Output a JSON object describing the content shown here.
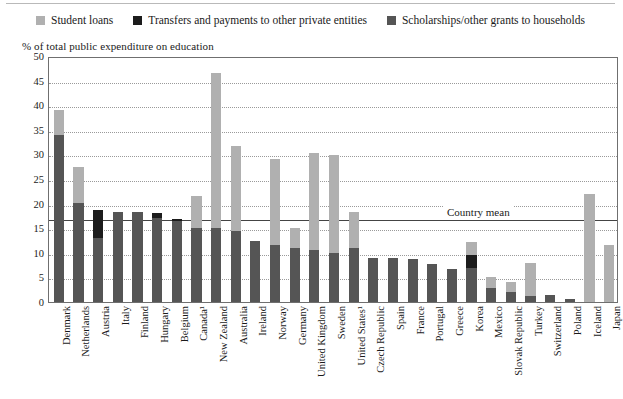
{
  "legend": {
    "items": [
      {
        "label": "Student loans",
        "color": "#b0b0b0",
        "key": "loans"
      },
      {
        "label": "Transfers and payments to other private entities",
        "color": "#1c1c1c",
        "key": "transfers"
      },
      {
        "label": "Scholarships/other grants to households",
        "color": "#555555",
        "key": "scholarships"
      }
    ]
  },
  "axis": {
    "ylabel": "% of total public expenditure on education",
    "yticks": [
      0,
      5,
      10,
      15,
      20,
      25,
      30,
      35,
      40,
      45,
      50
    ],
    "ymin": 0,
    "ymax": 50
  },
  "annotation": {
    "mean_label": "Country mean",
    "mean_value": 17
  },
  "chart_data": {
    "type": "bar",
    "stacked": true,
    "title": "",
    "xlabel": "",
    "ylabel": "% of total public expenditure on education",
    "ylim": [
      0,
      50
    ],
    "grid": true,
    "legend_position": "top",
    "categories": [
      "Denmark",
      "Netherlands",
      "Austria",
      "Italy",
      "Finland",
      "Hungary",
      "Belgium",
      "Canada¹",
      "New Zealand",
      "Australia",
      "Ireland",
      "Norway",
      "Germany",
      "United Kingdom",
      "Sweden",
      "United States¹",
      "Czech Republic",
      "Spain",
      "France",
      "Portugal",
      "Greece",
      "Korea",
      "Mexico",
      "Slovak Republic",
      "Turkey",
      "Switzerland",
      "Poland",
      "Iceland",
      "Japan"
    ],
    "series": [
      {
        "name": "Scholarships/other grants to households",
        "color": "#555555",
        "values": [
          34.0,
          20.2,
          13.0,
          18.3,
          18.2,
          17.0,
          16.4,
          15.0,
          15.0,
          14.5,
          12.3,
          11.5,
          11.0,
          10.5,
          10.0,
          11.0,
          9.0,
          9.0,
          8.8,
          7.8,
          6.8,
          7.0,
          2.8,
          2.0,
          1.2,
          1.4,
          0.7,
          0.0,
          0.0
        ]
      },
      {
        "name": "Transfers and payments to other private entities",
        "color": "#1c1c1c",
        "values": [
          0.0,
          0.0,
          5.7,
          0.0,
          0.0,
          1.0,
          0.4,
          0.0,
          0.0,
          0.0,
          0.0,
          0.0,
          0.0,
          0.0,
          0.0,
          0.0,
          0.0,
          0.0,
          0.0,
          0.0,
          0.0,
          2.6,
          0.0,
          0.0,
          0.0,
          0.0,
          0.0,
          0.0,
          0.0
        ]
      },
      {
        "name": "Student loans",
        "color": "#b0b0b0",
        "values": [
          5.0,
          7.3,
          0.0,
          0.0,
          0.0,
          0.0,
          0.0,
          6.5,
          31.5,
          17.3,
          0.0,
          17.5,
          4.0,
          19.7,
          19.8,
          7.2,
          0.0,
          0.0,
          0.0,
          0.0,
          0.0,
          2.7,
          2.2,
          2.0,
          6.8,
          0.0,
          0.0,
          22.0,
          11.5
        ]
      }
    ],
    "totals": [
      39.0,
      27.5,
      18.7,
      18.3,
      18.2,
      18.0,
      16.8,
      21.5,
      46.5,
      31.8,
      12.3,
      29.0,
      15.0,
      30.2,
      29.8,
      18.2,
      9.0,
      9.0,
      8.8,
      7.8,
      6.8,
      12.3,
      5.0,
      4.0,
      8.0,
      1.4,
      0.7,
      22.0,
      11.5
    ]
  }
}
